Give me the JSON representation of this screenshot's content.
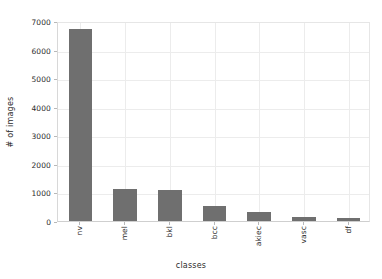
{
  "chart_data": {
    "type": "bar",
    "title": "",
    "subtitle": "",
    "xlabel": "classes",
    "ylabel": "# of images",
    "categories": [
      "nv",
      "mel",
      "bkl",
      "bcc",
      "akiec",
      "vasc",
      "df"
    ],
    "values": [
      6705,
      1113,
      1099,
      514,
      327,
      142,
      115
    ],
    "series": [
      {
        "name": "# of images",
        "values": [
          6705,
          1113,
          1099,
          514,
          327,
          142,
          115
        ]
      }
    ],
    "ylim": [
      0,
      7000
    ],
    "yticks": [
      0,
      1000,
      2000,
      3000,
      4000,
      5000,
      6000,
      7000
    ],
    "ytick_labels": [
      "0",
      "1000",
      "2000",
      "3000",
      "4000",
      "5000",
      "6000",
      "7000"
    ],
    "xtick_labels": [
      "nv",
      "mel",
      "bkl",
      "bcc",
      "akiec",
      "vasc",
      "df"
    ],
    "xtick_rotation": 90,
    "grid": true,
    "grid_axis": "both",
    "legend": false,
    "legend_position": "none",
    "bar_color": "#6f6f6f",
    "grid_color": "#ececec",
    "background_color": "#ffffff",
    "text_color": "#2b2b2b",
    "annotations": []
  }
}
